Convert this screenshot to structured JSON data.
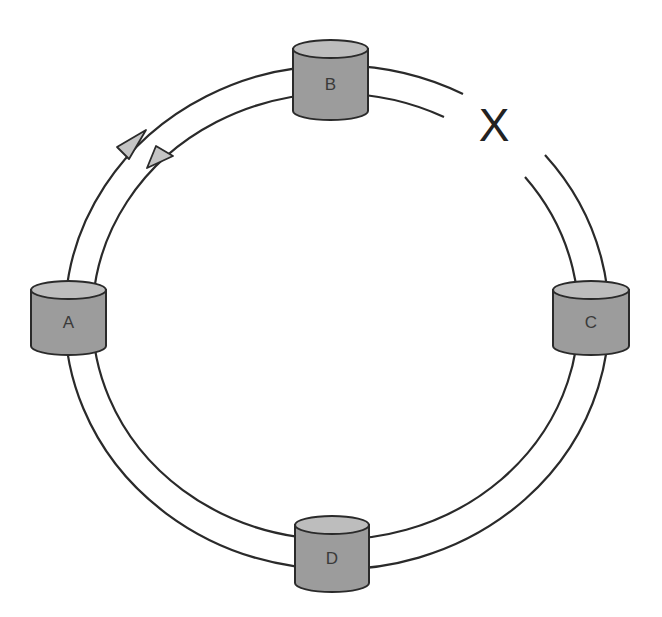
{
  "diagram": {
    "type": "dual-ring network",
    "rings": {
      "center": [
        331,
        318
      ],
      "outer": {
        "rx": 272,
        "ry": 252
      },
      "inner": {
        "rx": 243,
        "ry": 223
      },
      "break": {
        "between": [
          "B",
          "C"
        ],
        "outer_gap": {
          "from": [
            463,
            94
          ],
          "to": [
            545,
            155
          ]
        },
        "inner_gap": {
          "from": [
            444,
            117
          ],
          "to": [
            525,
            177
          ]
        }
      }
    },
    "nodes": [
      {
        "id": "A",
        "label": "A",
        "x": 31,
        "y": 281,
        "w": 75,
        "h": 74
      },
      {
        "id": "B",
        "label": "B",
        "x": 293,
        "y": 40,
        "w": 75,
        "h": 80
      },
      {
        "id": "C",
        "label": "C",
        "x": 553,
        "y": 281,
        "w": 76,
        "h": 74
      },
      {
        "id": "D",
        "label": "D",
        "x": 295,
        "y": 516,
        "w": 74,
        "h": 76
      }
    ],
    "break_marker": {
      "label": "X",
      "x": 494,
      "y": 129
    },
    "arrows": [
      {
        "ring": "outer",
        "direction": "clockwise",
        "points": [
          [
            146,
            130
          ],
          [
            117,
            147
          ],
          [
            129,
            159
          ]
        ]
      },
      {
        "ring": "inner",
        "direction": "counter-clockwise",
        "points": [
          [
            147,
            168
          ],
          [
            156,
            146
          ],
          [
            173,
            156
          ]
        ]
      }
    ],
    "colors": {
      "line": "#2a2a2a",
      "cylinder_body": "#9c9c9c",
      "cylinder_top": "#bdbdbd",
      "arrow_fill": "#c4c4c4",
      "background": "#ffffff"
    }
  }
}
